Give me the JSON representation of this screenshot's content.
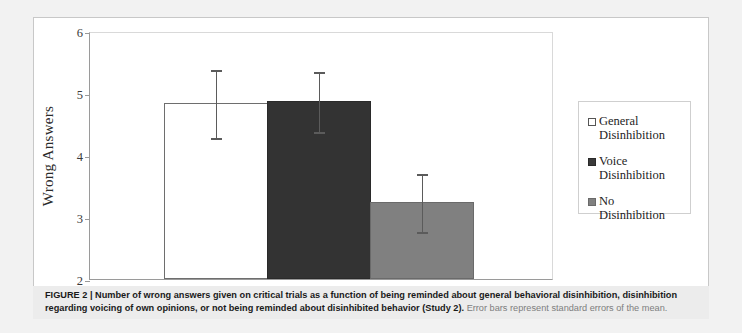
{
  "figure": {
    "caption_label": "FIGURE 2 |",
    "caption_bold": "Number of wrong answers given on critical trials as a function of being reminded about general behavioral disinhibition, disinhibition regarding voicing of own opinions, or not being reminded about disinhibited behavior (Study 2).",
    "caption_light": "Error bars represent standard errors of the mean."
  },
  "legend": {
    "entries": [
      {
        "label": "General Disinhibition",
        "swatch": "white-square-icon",
        "color": "#FFFFFF"
      },
      {
        "label": "Voice Disinhibition",
        "swatch": "dark-gray-square-icon",
        "color": "#333333"
      },
      {
        "label": "No Disinhibition",
        "swatch": "gray-square-icon",
        "color": "#808080"
      }
    ]
  },
  "axis": {
    "y_title": "Wrong Answers",
    "y_ticks": [
      "2",
      "3",
      "4",
      "5",
      "6"
    ]
  },
  "chart_data": {
    "type": "bar",
    "title": "",
    "xlabel": "",
    "ylabel": "Wrong Answers",
    "ylim": [
      2,
      6
    ],
    "yticks": [
      2,
      3,
      4,
      5,
      6
    ],
    "grid": false,
    "legend_position": "right",
    "categories": [
      "General Disinhibition",
      "Voice Disinhibition",
      "No Disinhibition"
    ],
    "values": [
      4.84,
      4.87,
      3.24
    ],
    "errors": [
      0.56,
      0.5,
      0.48
    ],
    "error_type": "standard error of the mean",
    "colors": [
      "#FFFFFF",
      "#333333",
      "#808080"
    ],
    "annotations": [
      "Error bars represent standard errors of the mean."
    ]
  }
}
